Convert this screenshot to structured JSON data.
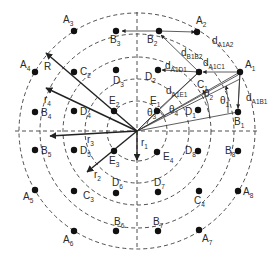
{
  "diagram": {
    "center": {
      "x": 137,
      "y": 131
    },
    "rings": [
      {
        "name": "r1",
        "radius": 30
      },
      {
        "name": "r2",
        "radius": 52
      },
      {
        "name": "r3",
        "radius": 74
      },
      {
        "name": "r4",
        "radius": 97
      },
      {
        "name": "R",
        "radius": 118
      }
    ],
    "points": [
      {
        "id": "A1",
        "base": "A",
        "sub": "1",
        "x": 240,
        "y": 72,
        "lx": 245,
        "ly": 68
      },
      {
        "id": "A2",
        "base": "A",
        "sub": "2",
        "x": 197,
        "y": 32,
        "lx": 196,
        "ly": 24
      },
      {
        "id": "A3",
        "base": "A",
        "sub": "3",
        "x": 74,
        "y": 31,
        "lx": 63,
        "ly": 23
      },
      {
        "id": "A4",
        "base": "A",
        "sub": "4",
        "x": 35,
        "y": 72,
        "lx": 20,
        "ly": 68
      },
      {
        "id": "A5",
        "base": "A",
        "sub": "5",
        "x": 35,
        "y": 190,
        "lx": 23,
        "ly": 200
      },
      {
        "id": "A6",
        "base": "A",
        "sub": "6",
        "x": 74,
        "y": 231,
        "lx": 63,
        "ly": 243
      },
      {
        "id": "A7",
        "base": "A",
        "sub": "7",
        "x": 199,
        "y": 230,
        "lx": 202,
        "ly": 242
      },
      {
        "id": "A8",
        "base": "A",
        "sub": "8",
        "x": 238,
        "y": 191,
        "lx": 243,
        "ly": 195
      },
      {
        "id": "B1",
        "base": "B",
        "sub": "1",
        "x": 238,
        "y": 112,
        "lx": 234,
        "ly": 125
      },
      {
        "id": "B2",
        "base": "B",
        "sub": "2",
        "x": 159,
        "y": 31,
        "lx": 147,
        "ly": 43
      },
      {
        "id": "B3",
        "base": "B",
        "sub": "3",
        "x": 116,
        "y": 31,
        "lx": 110,
        "ly": 43
      },
      {
        "id": "B4",
        "base": "B",
        "sub": "4",
        "x": 35,
        "y": 112,
        "lx": 41,
        "ly": 116
      },
      {
        "id": "B5",
        "base": "B",
        "sub": "5",
        "x": 35,
        "y": 150,
        "lx": 41,
        "ly": 154
      },
      {
        "id": "B6",
        "base": "B",
        "sub": "6",
        "x": 116,
        "y": 231,
        "lx": 114,
        "ly": 225
      },
      {
        "id": "B7",
        "base": "B",
        "sub": "7",
        "x": 158,
        "y": 231,
        "lx": 153,
        "ly": 225
      },
      {
        "id": "B8",
        "base": "B",
        "sub": "8",
        "x": 238,
        "y": 151,
        "lx": 225,
        "ly": 154
      },
      {
        "id": "C1",
        "base": "C",
        "sub": "1",
        "x": 199,
        "y": 72,
        "lx": 197,
        "ly": 88
      },
      {
        "id": "C2",
        "base": "C",
        "sub": "2",
        "x": 74,
        "y": 72,
        "lx": 80,
        "ly": 75
      },
      {
        "id": "C3",
        "base": "C",
        "sub": "3",
        "x": 74,
        "y": 191,
        "lx": 83,
        "ly": 199
      },
      {
        "id": "C4",
        "base": "C",
        "sub": "4",
        "x": 199,
        "y": 191,
        "lx": 194,
        "ly": 204
      },
      {
        "id": "D1",
        "base": "D",
        "sub": "1",
        "x": 198,
        "y": 110,
        "lx": 185,
        "ly": 115
      },
      {
        "id": "D2",
        "base": "D",
        "sub": "2",
        "x": 158,
        "y": 70,
        "lx": 145,
        "ly": 80
      },
      {
        "id": "D3",
        "base": "D",
        "sub": "3",
        "x": 116,
        "y": 70,
        "lx": 113,
        "ly": 84
      },
      {
        "id": "D4",
        "base": "D",
        "sub": "4",
        "x": 74,
        "y": 111,
        "lx": 80,
        "ly": 115
      },
      {
        "id": "D5",
        "base": "D",
        "sub": "5",
        "x": 74,
        "y": 150,
        "lx": 80,
        "ly": 154
      },
      {
        "id": "D6",
        "base": "D",
        "sub": "6",
        "x": 116,
        "y": 193,
        "lx": 112,
        "ly": 186
      },
      {
        "id": "D7",
        "base": "D",
        "sub": "7",
        "x": 158,
        "y": 192,
        "lx": 154,
        "ly": 186
      },
      {
        "id": "D8",
        "base": "D",
        "sub": "8",
        "x": 198,
        "y": 151,
        "lx": 185,
        "ly": 154
      },
      {
        "id": "E1",
        "base": "E",
        "sub": "1",
        "x": 157,
        "y": 111,
        "lx": 150,
        "ly": 104
      },
      {
        "id": "E2",
        "base": "E",
        "sub": "2",
        "x": 114,
        "y": 111,
        "lx": 109,
        "ly": 104
      },
      {
        "id": "E3",
        "base": "E",
        "sub": "3",
        "x": 114,
        "y": 151,
        "lx": 109,
        "ly": 164
      },
      {
        "id": "E4",
        "base": "E",
        "sub": "4",
        "x": 157,
        "y": 152,
        "lx": 163,
        "ly": 160
      }
    ],
    "radius_labels": [
      {
        "base": "R",
        "sub": "",
        "x": 44,
        "y": 70
      },
      {
        "base": "r",
        "sub": "4",
        "x": 44,
        "y": 103
      },
      {
        "base": "r",
        "sub": "3",
        "x": 87,
        "y": 143
      },
      {
        "base": "r",
        "sub": "2",
        "x": 94,
        "y": 178
      },
      {
        "base": "r",
        "sub": "1",
        "x": 141,
        "y": 146
      }
    ],
    "distance_labels": [
      {
        "base": "d",
        "sub": "A1A2",
        "x": 212,
        "y": 44
      },
      {
        "base": "d",
        "sub": "B1B2",
        "x": 181,
        "y": 56
      },
      {
        "base": "d",
        "sub": "A1C1",
        "x": 203,
        "y": 66
      },
      {
        "base": "d",
        "sub": "A1D1",
        "x": 165,
        "y": 69
      },
      {
        "base": "d",
        "sub": "A1E1",
        "x": 166,
        "y": 94
      },
      {
        "base": "d",
        "sub": "A1B1",
        "x": 246,
        "y": 101
      }
    ],
    "angle_labels": [
      {
        "base": "θ",
        "sub": "1",
        "x": 220,
        "y": 104
      },
      {
        "base": "θ",
        "sub": "2",
        "x": 204,
        "y": 97
      },
      {
        "base": "θ",
        "sub": "3",
        "x": 147,
        "y": 116
      },
      {
        "base": "θ",
        "sub": "4",
        "x": 169,
        "y": 113
      }
    ]
  }
}
